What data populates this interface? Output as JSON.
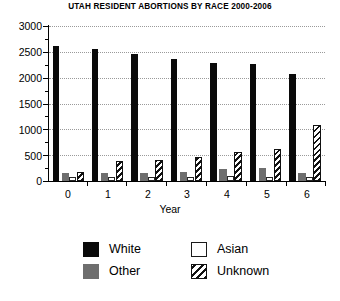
{
  "chart_data": {
    "type": "bar",
    "title": "UTAH RESIDENT ABORTIONS BY RACE 2000-2006",
    "xlabel": "Year",
    "ylabel": "",
    "categories": [
      "0",
      "1",
      "2",
      "3",
      "4",
      "5",
      "6"
    ],
    "ylim": [
      0,
      3000
    ],
    "yticks": [
      0,
      500,
      1000,
      1500,
      2000,
      2500,
      3000
    ],
    "ytick_labels": [
      "0",
      "500",
      "1000",
      "1500",
      "2000",
      "2500",
      "3000"
    ],
    "minor_ticks": true,
    "grid": "horizontal-dotted",
    "legend_position": "bottom",
    "series": [
      {
        "name": "White",
        "fill": "solid-black",
        "color": "#0a0a0a",
        "values": [
          2620,
          2555,
          2455,
          2360,
          2280,
          2260,
          2065
        ]
      },
      {
        "name": "Other",
        "fill": "solid-gray",
        "color": "#6e6e6e",
        "values": [
          160,
          150,
          155,
          180,
          230,
          250,
          160
        ]
      },
      {
        "name": "Asian",
        "fill": "empty-white",
        "color": "#ffffff",
        "values": [
          70,
          75,
          80,
          85,
          90,
          85,
          80
        ]
      },
      {
        "name": "Unknown",
        "fill": "diagonal-hatch",
        "color": "#111111",
        "values": [
          175,
          380,
          400,
          460,
          560,
          610,
          1075
        ]
      }
    ]
  },
  "legend": {
    "items": [
      {
        "label": "White",
        "swatch": "black-square-swatch"
      },
      {
        "label": "Asian",
        "swatch": "white-square-swatch"
      },
      {
        "label": "Other",
        "swatch": "gray-square-swatch"
      },
      {
        "label": "Unknown",
        "swatch": "hatched-square-swatch"
      }
    ]
  }
}
